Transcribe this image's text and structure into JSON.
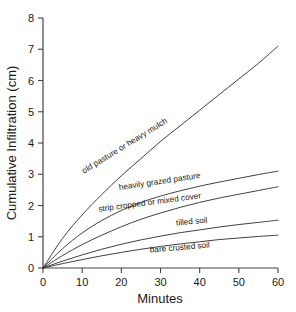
{
  "chart_data": {
    "type": "line",
    "title": "",
    "xlabel": "Minutes",
    "ylabel": "Cumulative Infiltration (cm)",
    "xlim": [
      0,
      60
    ],
    "ylim": [
      0,
      8
    ],
    "xticks": [
      0,
      10,
      20,
      30,
      40,
      50,
      60
    ],
    "yticks": [
      0,
      1,
      2,
      3,
      4,
      5,
      6,
      7,
      8
    ],
    "xtick_labels": [
      "0",
      "10",
      "20",
      "30",
      "40",
      "50",
      "60"
    ],
    "ytick_labels": [
      "0",
      "1",
      "2",
      "3",
      "4",
      "5",
      "6",
      "7",
      "8"
    ],
    "grid": false,
    "legend_position": "inline-curve-labels",
    "x": [
      0,
      5,
      10,
      15,
      20,
      25,
      30,
      35,
      40,
      45,
      50,
      55,
      60
    ],
    "series": [
      {
        "name": "old pasture or heavy mulch",
        "label": "old pasture or heavy mulch",
        "values": [
          0.0,
          0.95,
          1.7,
          2.35,
          2.95,
          3.5,
          4.05,
          4.55,
          5.05,
          5.55,
          6.05,
          6.55,
          7.1
        ]
      },
      {
        "name": "heavily grazed pasture",
        "label": "heavily grazed pasture",
        "values": [
          0.0,
          0.62,
          1.12,
          1.52,
          1.84,
          2.1,
          2.3,
          2.47,
          2.62,
          2.75,
          2.87,
          2.99,
          3.1
        ]
      },
      {
        "name": "strip cropped or mixed cover",
        "label": "strip cropped or mixed cover",
        "values": [
          0.0,
          0.4,
          0.75,
          1.05,
          1.32,
          1.56,
          1.76,
          1.94,
          2.1,
          2.24,
          2.36,
          2.48,
          2.6
        ]
      },
      {
        "name": "tilled soil",
        "label": "tilled soil",
        "values": [
          0.0,
          0.22,
          0.42,
          0.6,
          0.76,
          0.9,
          1.02,
          1.13,
          1.22,
          1.31,
          1.39,
          1.46,
          1.53
        ]
      },
      {
        "name": "bare crusted soil",
        "label": "bare crusted soil",
        "values": [
          0.0,
          0.14,
          0.27,
          0.39,
          0.5,
          0.6,
          0.69,
          0.77,
          0.84,
          0.91,
          0.96,
          1.01,
          1.05
        ]
      }
    ],
    "curve_labels": [
      {
        "text": "old pasture or heavy mulch",
        "x": 126,
        "y": 148,
        "rotate": -31.5
      },
      {
        "text": "heavily grazed pasture",
        "x": 160,
        "y": 184,
        "rotate": -8.5
      },
      {
        "text": "strip cropped or mixed cover",
        "x": 150,
        "y": 205,
        "rotate": -7.5
      },
      {
        "text": "tilled soil",
        "x": 192,
        "y": 224,
        "rotate": -5.5
      },
      {
        "text": "bare crusted soil",
        "x": 180,
        "y": 250,
        "rotate": -5.0
      }
    ],
    "colors": {
      "curve": "#2b2b2b",
      "axis": "#444444",
      "text": "#1a1a1a",
      "background": "#ffffff"
    }
  }
}
